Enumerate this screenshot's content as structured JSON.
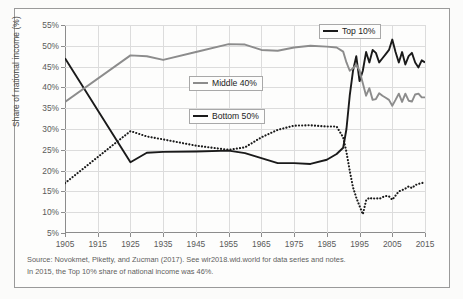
{
  "figure": {
    "ylabel": "Share of national income (%)",
    "source_lines": [
      "Source: Novokmet, Piketty, and Zucman (2017). See wir2018.wid.world for data series and notes.",
      "In 2015, the Top 10% share of national income was 46%."
    ]
  },
  "legend": {
    "top10": "Top 10%",
    "middle40": "Middle 40%",
    "bottom50": "Bottom 50%"
  },
  "colors": {
    "top10": "#1a1a1a",
    "middle40": "#8c8c8c",
    "bottom50": "#1a1a1a",
    "grid": "#dcdcdc",
    "axis": "#8c8c8c",
    "text": "#5a5a5a",
    "frame": "#9a9a9a",
    "background": "#fdfdfc"
  },
  "chart_data": {
    "type": "line",
    "title": "",
    "xlabel": "",
    "ylabel": "Share of national income (%)",
    "xlim": [
      1905,
      2015
    ],
    "ylim": [
      5,
      55
    ],
    "ytick_labels": [
      "5%",
      "10%",
      "15%",
      "20%",
      "25%",
      "30%",
      "35%",
      "40%",
      "45%",
      "50%",
      "55%"
    ],
    "yticks": [
      5,
      10,
      15,
      20,
      25,
      30,
      35,
      40,
      45,
      50,
      55
    ],
    "xticks": [
      1905,
      1915,
      1925,
      1935,
      1945,
      1955,
      1965,
      1975,
      1985,
      1995,
      2005,
      2015
    ],
    "grid": true,
    "legend_position": "inside",
    "series": [
      {
        "name": "Top 10%",
        "style": "solid",
        "color": "#1a1a1a",
        "x": [
          1905,
          1925,
          1930,
          1935,
          1945,
          1955,
          1960,
          1965,
          1970,
          1975,
          1980,
          1985,
          1988,
          1990,
          1991,
          1992,
          1993,
          1994,
          1995,
          1996,
          1997,
          1998,
          1999,
          2000,
          2001,
          2002,
          2003,
          2004,
          2005,
          2006,
          2007,
          2008,
          2009,
          2010,
          2011,
          2012,
          2013,
          2014,
          2015
        ],
        "y": [
          47.0,
          22.0,
          24.3,
          24.5,
          24.6,
          24.8,
          24.2,
          23.0,
          21.8,
          21.8,
          21.6,
          22.6,
          24.0,
          25.5,
          30.0,
          38.0,
          44.0,
          47.5,
          41.5,
          44.0,
          48.5,
          46.0,
          49.0,
          48.3,
          46.0,
          47.0,
          48.0,
          49.0,
          51.5,
          48.5,
          46.0,
          48.5,
          45.5,
          47.5,
          48.3,
          46.0,
          44.8,
          46.5,
          46.0
        ]
      },
      {
        "name": "Middle 40%",
        "style": "solid",
        "color": "#8c8c8c",
        "x": [
          1905,
          1925,
          1930,
          1935,
          1945,
          1955,
          1960,
          1965,
          1970,
          1975,
          1980,
          1985,
          1988,
          1990,
          1991,
          1992,
          1993,
          1994,
          1995,
          1996,
          1997,
          1998,
          1999,
          2000,
          2001,
          2002,
          2003,
          2004,
          2005,
          2006,
          2007,
          2008,
          2009,
          2010,
          2011,
          2012,
          2013,
          2014,
          2015
        ],
        "y": [
          36.5,
          47.7,
          47.5,
          46.6,
          48.5,
          50.4,
          50.3,
          49.0,
          48.8,
          49.6,
          50.0,
          49.8,
          49.6,
          48.6,
          46.0,
          44.0,
          44.6,
          45.5,
          44.0,
          41.0,
          38.0,
          39.8,
          37.0,
          37.2,
          38.6,
          38.0,
          37.5,
          37.0,
          35.6,
          37.0,
          38.5,
          36.5,
          38.5,
          36.8,
          36.6,
          38.3,
          38.5,
          37.6,
          37.6
        ]
      },
      {
        "name": "Bottom 50%",
        "style": "dotted",
        "color": "#1a1a1a",
        "x": [
          1905,
          1925,
          1930,
          1935,
          1945,
          1955,
          1960,
          1965,
          1970,
          1975,
          1980,
          1985,
          1988,
          1990,
          1991,
          1992,
          1993,
          1994,
          1995,
          1996,
          1997,
          1998,
          1999,
          2000,
          2001,
          2002,
          2003,
          2004,
          2005,
          2006,
          2007,
          2008,
          2009,
          2010,
          2011,
          2012,
          2013,
          2014,
          2015
        ],
        "y": [
          17.0,
          29.5,
          28.2,
          27.5,
          26.0,
          25.0,
          25.6,
          28.0,
          29.8,
          30.8,
          30.9,
          30.6,
          30.6,
          28.0,
          24.5,
          20.0,
          16.0,
          13.5,
          11.5,
          9.5,
          12.8,
          13.5,
          13.2,
          13.4,
          13.2,
          13.6,
          13.9,
          13.8,
          13.0,
          14.0,
          15.0,
          15.3,
          15.7,
          16.2,
          15.8,
          16.5,
          16.8,
          17.0,
          17.2
        ]
      }
    ]
  }
}
